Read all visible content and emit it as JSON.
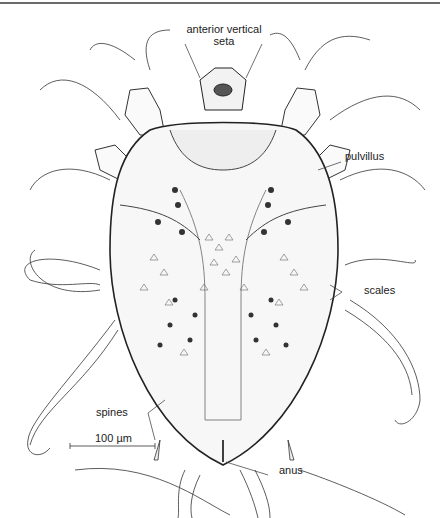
{
  "figure": {
    "labels": {
      "anterior_vertical_seta_line1": "anterior vertical",
      "anterior_vertical_seta_line2": "seta",
      "pulvillus": "pulvillus",
      "scales": "scales",
      "spines": "spines",
      "anus": "anus",
      "scale_bar": "100 µm"
    },
    "colors": {
      "ink": "#222222",
      "rule": "#6a6a6a",
      "background": "#ffffff"
    }
  }
}
